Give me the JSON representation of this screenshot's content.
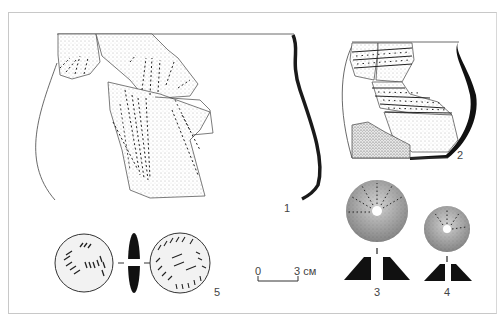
{
  "figure": {
    "labels": {
      "item1": "1",
      "item2": "2",
      "item3": "3",
      "item4": "4",
      "item5": "5"
    },
    "scale_bar": {
      "start": "0",
      "end": "3 см"
    }
  }
}
